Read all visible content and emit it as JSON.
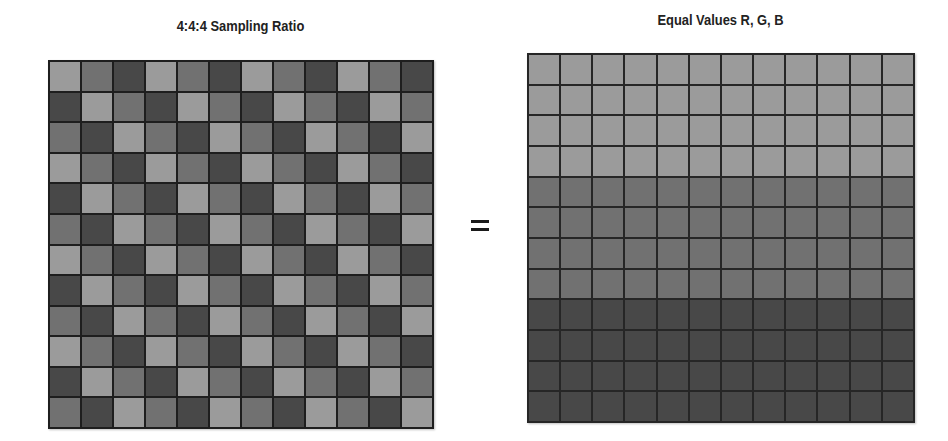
{
  "left_panel": {
    "title": "4:4:4 Sampling Ratio",
    "rows": 12,
    "cols": 12,
    "pattern": "diagonal cycle: shade index = (col - row) mod 3",
    "shades": [
      "light",
      "medium",
      "dark"
    ]
  },
  "operator": {
    "symbol": "=",
    "icon": "equals-sign-icon"
  },
  "right_panel": {
    "title": "Equal Values R, G, B",
    "rows": 12,
    "cols": 12,
    "row_bands": [
      {
        "shade": "light",
        "rows": 4
      },
      {
        "shade": "medium",
        "rows": 4
      },
      {
        "shade": "dark",
        "rows": 4
      }
    ]
  },
  "colors": {
    "light": "#9b9b9b",
    "medium": "#717171",
    "dark": "#484848",
    "gridline": "#1e1e1e",
    "text": "#222222",
    "background": "#ffffff"
  }
}
